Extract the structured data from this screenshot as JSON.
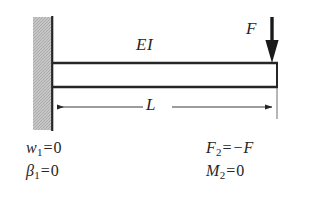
{
  "figure": {
    "kind": "cantilever-beam-free-body-diagram",
    "background_color": "#ffffff",
    "line_color": "#262626",
    "wall_fill_color": "#bdbdbd",
    "wall_edge_color": "#262626"
  },
  "labels": {
    "beam_stiffness": "EI",
    "applied_force": "F",
    "length": "L"
  },
  "boundary_conditions": {
    "left": [
      {
        "symbol": "w",
        "subscript": "1",
        "operator": "=",
        "value": "0"
      },
      {
        "symbol": "β",
        "subscript": "1",
        "operator": "=",
        "value": "0"
      }
    ],
    "right": [
      {
        "symbol": "F",
        "subscript": "2",
        "operator": "=",
        "value": "−F"
      },
      {
        "symbol": "M",
        "subscript": "2",
        "operator": "=",
        "value": "0"
      }
    ]
  },
  "geometry": {
    "wall": {
      "x": 33,
      "y": 17,
      "width": 19,
      "height": 113
    },
    "wall_face_line_x": 52,
    "beam": {
      "x": 52,
      "y": 62,
      "width": 225,
      "height": 26
    },
    "force_arrow": {
      "x": 272,
      "y_top": 17,
      "y_tip": 62,
      "direction": "down"
    },
    "dimension_line": {
      "y": 107,
      "x_start": 53,
      "x_end": 277
    },
    "extension_line": {
      "x": 277,
      "y_top": 88,
      "y_bottom": 118
    }
  }
}
